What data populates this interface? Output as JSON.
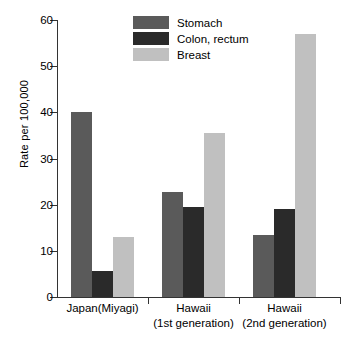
{
  "chart_data": {
    "type": "bar",
    "title": "",
    "xlabel": "",
    "ylabel": "Rate per 100,000",
    "ylim": [
      0,
      60
    ],
    "yticks": [
      0,
      10,
      20,
      30,
      40,
      50,
      60
    ],
    "ytick_labels": [
      "0",
      "10",
      "20",
      "30",
      "40",
      "50",
      "60"
    ],
    "grid": false,
    "legend_position": "top-center",
    "categories": [
      "Japan(Miyagi)",
      "Hawaii (1st generation)",
      "Hawaii (2nd generation)"
    ],
    "category_lines": [
      {
        "line1": "Japan(Miyagi)",
        "line2": ""
      },
      {
        "line1": "Hawaii",
        "line2": "(1st generation)"
      },
      {
        "line1": "Hawaii",
        "line2": "(2nd  generation)"
      }
    ],
    "series": [
      {
        "name": "Stomach",
        "color": "#5a5a5a",
        "values": [
          40.0,
          22.7,
          13.4
        ]
      },
      {
        "name": "Colon, rectum",
        "color": "#2a2a2a",
        "values": [
          5.6,
          19.4,
          19.0
        ]
      },
      {
        "name": "Breast",
        "color": "#c0c0c0",
        "values": [
          13.0,
          35.5,
          57.0
        ]
      }
    ]
  },
  "legend": {
    "items": [
      {
        "label": "Stomach",
        "color": "#5a5a5a"
      },
      {
        "label": "Colon, rectum",
        "color": "#2a2a2a"
      },
      {
        "label": "Breast",
        "color": "#c0c0c0"
      }
    ]
  },
  "axes": {
    "y_title": "Rate per 100,000"
  }
}
